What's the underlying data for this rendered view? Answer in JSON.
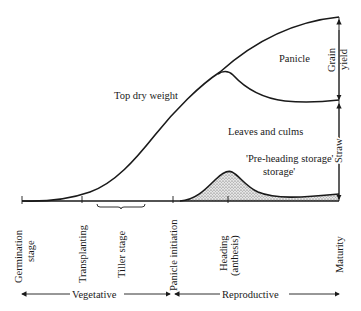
{
  "diagram": {
    "curves": {
      "top_dry_weight": "Top dry weight",
      "panicle": "Panicle",
      "leaves_culms": "Leaves and culms",
      "pre_heading_storage": "'Pre-heading storage'"
    },
    "right_brackets": {
      "grain_yield_line1": "Grain",
      "grain_yield_line2": "yield",
      "straw": "Straw"
    },
    "stages": {
      "germination_line1": "Germination",
      "germination_line2": "stage",
      "transplanting": "Transplanting",
      "tiller": "Tiller stage",
      "panicle_initiation": "Panicle initiation",
      "heading_line1": "Heading",
      "heading_line2": "(anthesis)",
      "maturity": "Maturity"
    },
    "phases": {
      "vegetative": "Vegetative",
      "reproductive": "Reproductive"
    },
    "colors": {
      "ink": "#1a1a1a",
      "stipple": "#b8b8b8"
    }
  }
}
